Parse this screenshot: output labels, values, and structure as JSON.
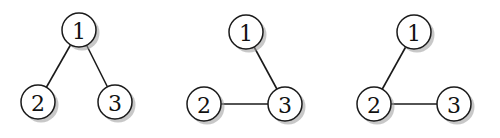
{
  "style": {
    "node_radius": 17,
    "stroke_color": "#1a1a1a",
    "fill_color": "#ffffff",
    "shadow_color": "#9a9a9a"
  },
  "graphs": [
    {
      "name": "tree-1",
      "nodes": [
        {
          "id": "1",
          "label": "1",
          "x": 79,
          "y": 30
        },
        {
          "id": "2",
          "label": "2",
          "x": 38,
          "y": 102
        },
        {
          "id": "3",
          "label": "3",
          "x": 115,
          "y": 102
        }
      ],
      "edges": [
        [
          "1",
          "2"
        ],
        [
          "1",
          "3"
        ]
      ]
    },
    {
      "name": "tree-2",
      "nodes": [
        {
          "id": "1",
          "label": "1",
          "x": 246,
          "y": 32
        },
        {
          "id": "2",
          "label": "2",
          "x": 204,
          "y": 104
        },
        {
          "id": "3",
          "label": "3",
          "x": 285,
          "y": 104
        }
      ],
      "edges": [
        [
          "1",
          "3"
        ],
        [
          "2",
          "3"
        ]
      ]
    },
    {
      "name": "tree-3",
      "nodes": [
        {
          "id": "1",
          "label": "1",
          "x": 414,
          "y": 32
        },
        {
          "id": "2",
          "label": "2",
          "x": 374,
          "y": 104
        },
        {
          "id": "3",
          "label": "3",
          "x": 454,
          "y": 104
        }
      ],
      "edges": [
        [
          "1",
          "2"
        ],
        [
          "2",
          "3"
        ]
      ]
    }
  ]
}
